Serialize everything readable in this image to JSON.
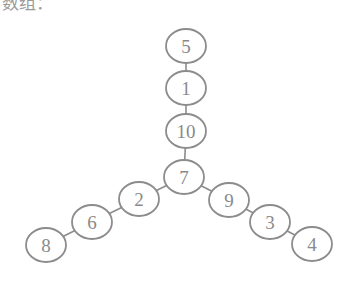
{
  "header": {
    "partial_text": "数组："
  },
  "tree": {
    "nodes": [
      {
        "id": "5",
        "label": "5",
        "cx": 186,
        "cy": 46
      },
      {
        "id": "1",
        "label": "1",
        "cx": 186,
        "cy": 88
      },
      {
        "id": "10",
        "label": "10",
        "cx": 186,
        "cy": 131
      },
      {
        "id": "7",
        "label": "7",
        "cx": 184,
        "cy": 177
      },
      {
        "id": "2",
        "label": "2",
        "cx": 139,
        "cy": 199
      },
      {
        "id": "6",
        "label": "6",
        "cx": 92,
        "cy": 222
      },
      {
        "id": "8",
        "label": "8",
        "cx": 46,
        "cy": 245
      },
      {
        "id": "9",
        "label": "9",
        "cx": 229,
        "cy": 200
      },
      {
        "id": "3",
        "label": "3",
        "cx": 270,
        "cy": 222
      },
      {
        "id": "4",
        "label": "4",
        "cx": 312,
        "cy": 244
      }
    ],
    "edges": [
      [
        "5",
        "1"
      ],
      [
        "1",
        "10"
      ],
      [
        "10",
        "7"
      ],
      [
        "7",
        "2"
      ],
      [
        "2",
        "6"
      ],
      [
        "6",
        "8"
      ],
      [
        "7",
        "9"
      ],
      [
        "9",
        "3"
      ],
      [
        "3",
        "4"
      ]
    ],
    "node_rx": 20,
    "node_ry": 17,
    "colors": {
      "stroke": "#8c8c8c",
      "text": "#8a8a8a",
      "fill": "#ffffff"
    }
  }
}
